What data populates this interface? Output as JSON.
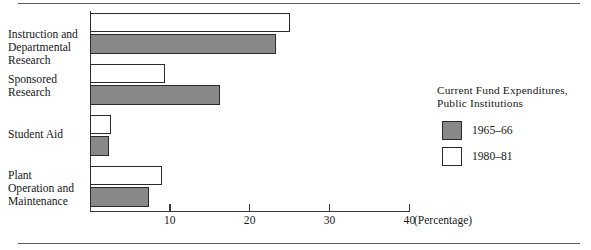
{
  "chart_data": {
    "type": "bar",
    "orientation": "horizontal",
    "title": "",
    "xlabel": "(Percentage)",
    "ylabel": "",
    "xlim": [
      0,
      40
    ],
    "xticks": [
      10,
      20,
      30,
      40
    ],
    "xticklabels": [
      "10",
      "20",
      "30",
      "40"
    ],
    "grid": false,
    "categories": [
      "Instruction and\nDepartmental\nResearch",
      "Sponsored\nResearch",
      "Student Aid",
      "Plant\nOperation and\nMaintenance"
    ],
    "series": [
      {
        "name": "1980–81",
        "color": "#ffffff",
        "values": [
          25.0,
          9.4,
          2.6,
          9.0
        ]
      },
      {
        "name": "1965–66",
        "color": "#888888",
        "values": [
          23.3,
          16.3,
          2.4,
          7.4
        ]
      }
    ],
    "legend_position": "right",
    "legend_title": "Current Fund Expenditures,\nPublic Institutions"
  },
  "axis": {
    "unit_label": "(Percentage)",
    "tick_10": "10",
    "tick_20": "20",
    "tick_30": "30",
    "tick_40": "40"
  },
  "categories": {
    "c0": "Instruction and Departmental Research",
    "c1": "Sponsored Research",
    "c2": "Student Aid",
    "c3": "Plant Operation and Maintenance"
  },
  "legend": {
    "title": "Current Fund Expenditures,\nPublic Institutions",
    "items": [
      {
        "label": "1965–66",
        "swatch": "gray"
      },
      {
        "label": "1980–81",
        "swatch": "white"
      }
    ]
  }
}
